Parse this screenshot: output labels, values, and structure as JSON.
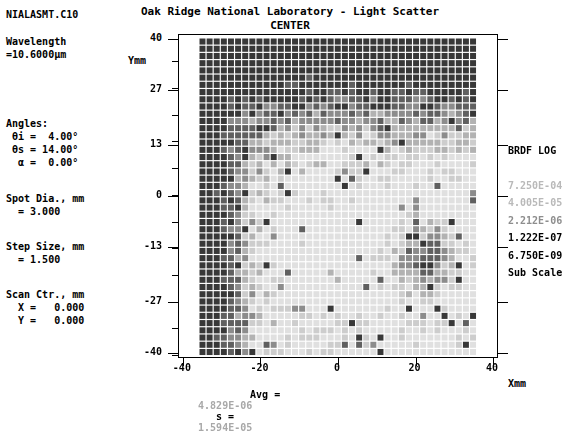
{
  "header": {
    "title": "Oak Ridge National Laboratory - Light Scatter",
    "subtitle": "CENTER"
  },
  "file_label": "NIALASMT.C10",
  "parameters": {
    "wavelength_label": "Wavelength",
    "wavelength_value": "=10.6000µm",
    "angles_label": "Angles:",
    "theta_i": " θi =  4.00°",
    "theta_s": " θs = 14.00°",
    "alpha": "  α =  0.00°",
    "spot_dia_label": "Spot Dia., mm",
    "spot_dia_value": "  = 3.000",
    "step_size_label": "Step Size, mm",
    "step_size_value": "  = 1.500",
    "scan_ctr_label": "Scan Ctr., mm",
    "scan_ctr_x": "  X =   0.000",
    "scan_ctr_y": "  Y =   0.000"
  },
  "legend": {
    "title": "BRDF LOG",
    "values": [
      "7.250E-04",
      "4.005E-05",
      "2.212E-06",
      "1.222E-07",
      "6.750E-09"
    ],
    "footer": "Sub Scale"
  },
  "stats": {
    "avg_label": "Avg =",
    "avg_value": "4.829E-06",
    "s_label": "s =",
    "s_value": "1.594E-05"
  },
  "axes": {
    "x_title": "Xmm",
    "y_title": "Ymm",
    "x_ticks": [
      "-40",
      "-20",
      "0",
      "20",
      "40"
    ],
    "y_ticks": [
      "40",
      "27",
      "13",
      "0",
      "-13",
      "-27",
      "-40"
    ],
    "x_range": [
      -40,
      40
    ],
    "y_range": [
      -40,
      40
    ]
  },
  "chart_data": {
    "type": "heatmap",
    "title": "Oak Ridge National Laboratory - Light Scatter",
    "subtitle": "CENTER",
    "xlabel": "Xmm",
    "ylabel": "Ymm",
    "xlim": [
      -40,
      40
    ],
    "ylim": [
      -40,
      40
    ],
    "colorbar_label": "BRDF LOG",
    "colorbar_ticks": [
      "7.250E-04",
      "4.005E-05",
      "2.212E-06",
      "1.222E-07",
      "6.750E-09"
    ],
    "grid_cols": 39,
    "grid_rows": 44,
    "data_x_min": -32.5,
    "data_x_max": 34.5,
    "data_y_min": -41.0,
    "data_y_max": 41.0,
    "value_scale": "log",
    "legend_position": "right",
    "grid": false
  }
}
